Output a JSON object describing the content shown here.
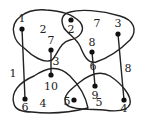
{
  "diagram": {
    "type": "hypergraph",
    "colors": {
      "stroke": "#222222",
      "background": "#ffffff"
    },
    "vertices": [
      {
        "id": "1",
        "label": "1",
        "x": 22,
        "y": 29,
        "lx": 22,
        "ly": 22
      },
      {
        "id": "2",
        "label": "2",
        "x": 71,
        "y": 20,
        "lx": 71,
        "ly": 33
      },
      {
        "id": "7",
        "label": "7",
        "x": 51,
        "y": 50,
        "lx": 51,
        "ly": 44
      },
      {
        "id": "3",
        "label": "3",
        "x": 118,
        "y": 34,
        "lx": 118,
        "ly": 27
      },
      {
        "id": "8",
        "label": "8",
        "x": 92,
        "y": 52,
        "lx": 92,
        "ly": 46
      },
      {
        "id": "10",
        "label": "10",
        "x": 51,
        "y": 75,
        "lx": 51,
        "ly": 90
      },
      {
        "id": "6",
        "label": "6",
        "x": 25,
        "y": 99,
        "lx": 25,
        "ly": 111
      },
      {
        "id": "9",
        "label": "9",
        "x": 95,
        "y": 86,
        "lx": 95,
        "ly": 99
      },
      {
        "id": "5",
        "label": "5",
        "x": 74,
        "y": 100,
        "lx": 67,
        "ly": 105
      },
      {
        "id": "4",
        "label": "4",
        "x": 124,
        "y": 100,
        "lx": 124,
        "ly": 112
      }
    ],
    "hyperedges": [
      {
        "id": "2",
        "label": "2",
        "lx": 43,
        "ly": 33,
        "members": [
          "1",
          "2",
          "7"
        ]
      },
      {
        "id": "7",
        "label": "7",
        "lx": 97,
        "ly": 27,
        "members": [
          "2",
          "3",
          "8"
        ]
      },
      {
        "id": "4",
        "label": "4",
        "lx": 43,
        "ly": 107,
        "members": [
          "10",
          "6",
          "5"
        ]
      },
      {
        "id": "5",
        "label": "5",
        "lx": 99,
        "ly": 106,
        "members": [
          "9",
          "5",
          "4"
        ]
      }
    ],
    "edges": [
      {
        "id": "1",
        "label": "1",
        "from": "1",
        "to": "6",
        "lx": 13,
        "ly": 77
      },
      {
        "id": "3",
        "label": "3",
        "from": "7",
        "to": "10",
        "lx": 56,
        "ly": 65
      },
      {
        "id": "6",
        "label": "6",
        "from": "8",
        "to": "9",
        "lx": 93,
        "ly": 70
      },
      {
        "id": "8",
        "label": "8",
        "from": "3",
        "to": "4",
        "lx": 128,
        "ly": 72
      }
    ]
  }
}
